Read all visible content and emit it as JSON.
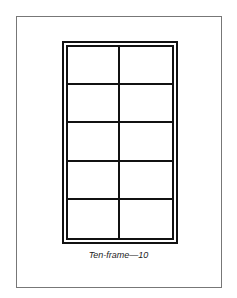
{
  "caption": "Ten-frame—10",
  "frame": {
    "rows": 5,
    "columns": 2,
    "cells": 10
  }
}
